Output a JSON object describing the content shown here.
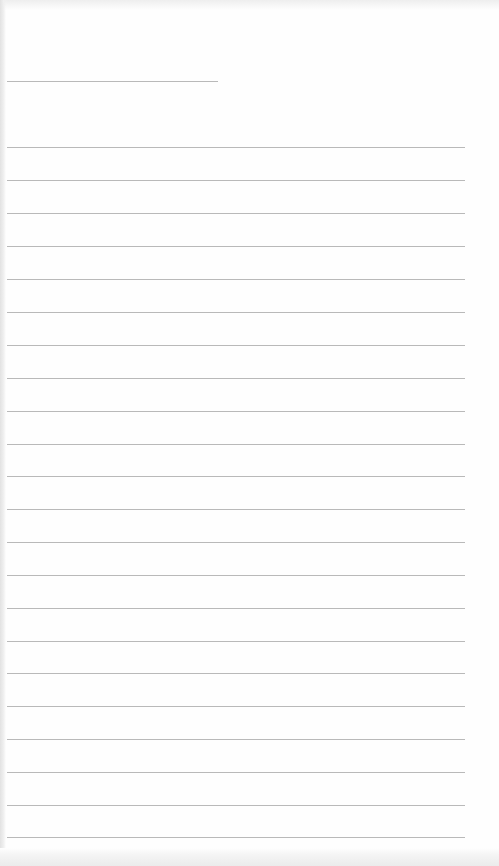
{
  "page": {
    "type": "ruled-notebook-page",
    "header_rule": {
      "x": 7,
      "y": 81,
      "width": 211
    },
    "rules": {
      "x": 7,
      "width": 458,
      "y_positions": [
        147,
        180,
        213,
        246,
        279,
        312,
        345,
        378,
        411,
        444,
        476,
        509,
        542,
        575,
        608,
        641,
        673,
        706,
        739,
        772,
        805,
        837
      ]
    },
    "colors": {
      "paper": "#fefefe",
      "rule": "#b9b9b9",
      "edge_shadow": "#e2e2e2"
    }
  }
}
